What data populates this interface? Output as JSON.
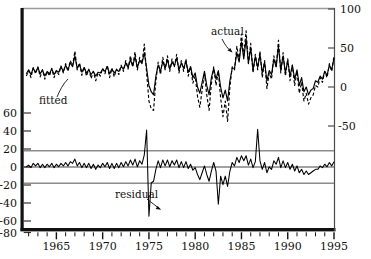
{
  "chart_data": {
    "type": "line",
    "title": "",
    "subtitle": "",
    "xlabel": "",
    "ylabel": "",
    "xlim": [
      1961.5,
      1995.0
    ],
    "grid": false,
    "legend_position": "inline-annotations",
    "annotations": [
      {
        "text": "actual",
        "x": 1983.0,
        "y_axis": "right",
        "points_to": "actual-dashed-series"
      },
      {
        "text": "fitted",
        "x": 1968.2,
        "y_axis": "right",
        "points_to": "fitted-solid-series"
      },
      {
        "text": "residual",
        "x": 1974.0,
        "y_axis": "left",
        "points_to": "residual-series"
      }
    ],
    "axes": [
      {
        "name": "right-axis",
        "side": "right",
        "ylim": [
          -75,
          100
        ],
        "ticks": [
          100,
          50,
          0,
          -50
        ],
        "tick_labels": [
          "100",
          "50",
          "0",
          "-50"
        ],
        "panel": "top"
      },
      {
        "name": "left-axis",
        "side": "left",
        "ylim": [
          -80,
          70
        ],
        "ticks": [
          60,
          40,
          20,
          0,
          -20,
          -40,
          -60,
          -80
        ],
        "tick_labels": [
          "60",
          "40",
          "20",
          "0",
          "-20",
          "-40",
          "-60",
          "-80"
        ],
        "panel": "bottom"
      }
    ],
    "x_ticks_major": [
      1965,
      1970,
      1975,
      1980,
      1985,
      1990,
      1995
    ],
    "x_tick_labels": [
      "1965",
      "1970",
      "1975",
      "1980",
      "1985",
      "1990",
      "1995"
    ],
    "x_ticks_minor_step": 1,
    "reference_lines": {
      "zero": 0,
      "bands": [
        18,
        -18
      ],
      "band_color": "#8c8c8c",
      "zero_color": "#333333"
    },
    "series": [
      {
        "name": "actual",
        "style": "dashed",
        "color": "#000000",
        "axis": "right",
        "x_start": 1961.75,
        "x_step": 0.25,
        "values": [
          14,
          21,
          12,
          25,
          17,
          26,
          13,
          22,
          10,
          20,
          14,
          24,
          12,
          21,
          16,
          27,
          18,
          30,
          20,
          34,
          27,
          46,
          22,
          31,
          15,
          26,
          14,
          23,
          11,
          20,
          8,
          18,
          14,
          24,
          17,
          28,
          12,
          24,
          13,
          23,
          16,
          28,
          20,
          34,
          23,
          40,
          26,
          45,
          22,
          38,
          30,
          55,
          18,
          -18,
          -28,
          -30,
          8,
          32,
          16,
          38,
          22,
          40,
          20,
          36,
          26,
          42,
          18,
          34,
          20,
          36,
          14,
          26,
          5,
          14,
          -12,
          -26,
          -4,
          18,
          -10,
          -30,
          4,
          26,
          2,
          20,
          -14,
          -38,
          -18,
          -44,
          0,
          26,
          22,
          52,
          34,
          68,
          40,
          72,
          30,
          56,
          18,
          42,
          22,
          46,
          12,
          34,
          -2,
          18,
          10,
          40,
          26,
          60,
          18,
          44,
          14,
          36,
          8,
          28,
          2,
          20,
          -8,
          6,
          -18,
          -8,
          -22,
          -14,
          -10,
          2,
          0,
          12,
          6,
          20,
          12,
          30,
          20,
          40,
          28,
          48,
          32,
          52
        ]
      },
      {
        "name": "fitted",
        "style": "solid",
        "color": "#000000",
        "axis": "right",
        "x_start": 1961.75,
        "x_step": 0.25,
        "values": [
          17,
          22,
          16,
          24,
          19,
          25,
          17,
          22,
          14,
          20,
          17,
          23,
          16,
          21,
          19,
          26,
          20,
          28,
          22,
          31,
          26,
          40,
          24,
          29,
          19,
          25,
          18,
          22,
          16,
          20,
          14,
          19,
          18,
          23,
          20,
          26,
          17,
          23,
          18,
          22,
          20,
          26,
          23,
          31,
          25,
          35,
          27,
          39,
          25,
          34,
          30,
          44,
          24,
          2,
          -6,
          -10,
          14,
          28,
          20,
          33,
          24,
          35,
          23,
          32,
          27,
          37,
          22,
          31,
          24,
          33,
          19,
          26,
          12,
          18,
          0,
          -8,
          6,
          20,
          2,
          -10,
          12,
          24,
          10,
          21,
          0,
          -14,
          -4,
          -18,
          8,
          24,
          24,
          44,
          32,
          58,
          36,
          62,
          31,
          50,
          22,
          39,
          25,
          42,
          18,
          32,
          8,
          21,
          16,
          36,
          26,
          52,
          22,
          40,
          18,
          34,
          14,
          28,
          10,
          22,
          2,
          12,
          -6,
          0,
          -10,
          -4,
          -2,
          8,
          6,
          14,
          10,
          20,
          15,
          28,
          22,
          37,
          29,
          44,
          33,
          48
        ]
      },
      {
        "name": "residual",
        "style": "solid",
        "color": "#000000",
        "axis": "left",
        "x_start": 1961.75,
        "x_step": 0.25,
        "values": [
          -3,
          -1,
          -4,
          1,
          -2,
          1,
          -4,
          0,
          -4,
          0,
          -3,
          1,
          -4,
          0,
          -3,
          1,
          -2,
          2,
          -2,
          3,
          1,
          6,
          -2,
          2,
          -4,
          1,
          -4,
          1,
          -5,
          0,
          -6,
          -1,
          -4,
          1,
          -3,
          2,
          -5,
          1,
          -5,
          1,
          -4,
          2,
          -3,
          3,
          -2,
          5,
          -1,
          6,
          -3,
          4,
          0,
          11,
          -6,
          -20,
          -22,
          -20,
          -6,
          4,
          -4,
          5,
          -2,
          5,
          -3,
          4,
          -1,
          5,
          -4,
          3,
          -4,
          3,
          -5,
          0,
          -7,
          -4,
          -12,
          -18,
          -10,
          -2,
          -12,
          -20,
          -8,
          2,
          -8,
          -1,
          -14,
          -24,
          -14,
          -26,
          -8,
          2,
          -2,
          8,
          2,
          10,
          4,
          10,
          -1,
          6,
          -4,
          3,
          -3,
          4,
          -6,
          2,
          -10,
          -3,
          -6,
          4,
          0,
          8,
          -4,
          4,
          -4,
          2,
          -6,
          0,
          -8,
          -2,
          -10,
          -6,
          -12,
          -8,
          -12,
          -10,
          -8,
          -6,
          -6,
          -2,
          -4,
          0,
          -3,
          2,
          -2,
          3,
          -1,
          4,
          -1,
          4
        ]
      }
    ],
    "residual_spikes": [
      {
        "x": 1975.0,
        "value": -61,
        "label": "largest negative residual"
      },
      {
        "x": 1974.75,
        "value": 40,
        "label": "largest positive residual"
      },
      {
        "x": 1986.75,
        "value": 41,
        "label": "secondary positive spike"
      },
      {
        "x": 1982.5,
        "value": -47,
        "label": "secondary negative spike"
      }
    ]
  },
  "labels": {
    "actual": "actual",
    "fitted": "fitted",
    "residual": "residual"
  }
}
